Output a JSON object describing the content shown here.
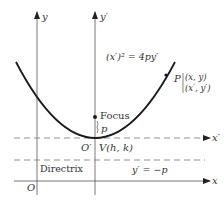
{
  "diagram": {
    "type": "parabola-translated-axes",
    "axes": {
      "y": "y",
      "y_prime": "y′",
      "x": "x",
      "x_prime": "x′",
      "origin": "O",
      "origin_prime": "O′"
    },
    "equation": "(x′)² = 4py′",
    "point": {
      "name": "P",
      "coords_xy": "(x, y)",
      "coords_prime": "(x′, y′)"
    },
    "focus_label": "Focus",
    "distance_label": "p",
    "vertex_label": "V(h, k)",
    "directrix_label": "Directrix",
    "directrix_equation": "y′ = −p",
    "colors": {
      "curve": "#1a1a1a",
      "axes": "#555555",
      "dashed": "#777777",
      "text": "#333333"
    }
  }
}
